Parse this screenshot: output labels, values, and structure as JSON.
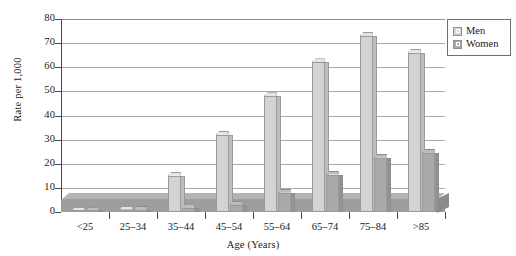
{
  "chart_data": {
    "type": "bar",
    "title": "",
    "xlabel": "Age (Years)",
    "ylabel": "Rate per 1,000",
    "categories": [
      "<25",
      "25–34",
      "35–44",
      "45–54",
      "55–64",
      "65–74",
      "75–84",
      ">85"
    ],
    "series": [
      {
        "name": "Men",
        "values": [
          0.5,
          1.0,
          15.0,
          32.0,
          48.0,
          62.0,
          73.0,
          66.0
        ]
      },
      {
        "name": "Women",
        "values": [
          0.3,
          0.8,
          1.5,
          3.0,
          8.0,
          15.5,
          22.5,
          24.5
        ]
      }
    ],
    "ylim": [
      0,
      80
    ],
    "yticks": [
      0,
      10,
      20,
      30,
      40,
      50,
      60,
      70,
      80
    ],
    "ytick_labels": [
      "0",
      "10",
      "20",
      "30",
      "40",
      "50",
      "60",
      "70",
      "80"
    ],
    "grid": true,
    "legend_position": "top-right",
    "style_3d": true,
    "colors": {
      "men": "#d3d3d3",
      "women": "#a9a9a9",
      "gridline": "#a8a8a8",
      "axis": "#4a4a4a",
      "floor": "#9e9e9e",
      "background": "#ffffff"
    }
  },
  "legend": {
    "entries": [
      {
        "label": "Men",
        "swatch": "men"
      },
      {
        "label": "Women",
        "swatch": "women"
      }
    ]
  }
}
